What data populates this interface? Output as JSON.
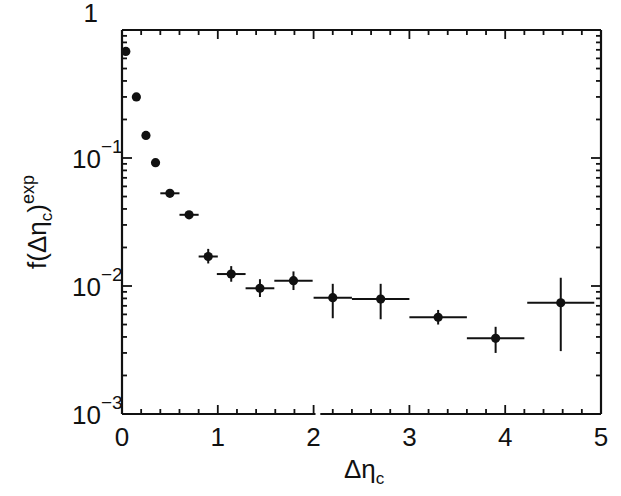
{
  "chart_data": {
    "type": "scatter",
    "title": "",
    "xlabel": "Δη_c",
    "ylabel": "f(Δη_c)^exp",
    "xscale": "linear",
    "yscale": "log",
    "xlim": [
      0,
      5
    ],
    "ylim": [
      0.001,
      1
    ],
    "grid": false,
    "legend": null,
    "x_ticks": [
      0,
      1,
      2,
      3,
      4,
      5
    ],
    "x_tick_labels": [
      "0",
      "1",
      "2",
      "3",
      "4",
      "5"
    ],
    "y_ticks": [
      1,
      0.1,
      0.01,
      0.001
    ],
    "y_tick_labels": [
      {
        "base": "1",
        "exp": ""
      },
      {
        "base": "10",
        "exp": "−1"
      },
      {
        "base": "10",
        "exp": "−2"
      },
      {
        "base": "10",
        "exp": "−3"
      }
    ],
    "series": [
      {
        "name": "data",
        "marker": "filled-circle",
        "points": [
          {
            "x": 0.04,
            "y": 0.68,
            "xerr": 0.04,
            "ylo": 0.68,
            "yhi": 0.68
          },
          {
            "x": 0.15,
            "y": 0.3,
            "xerr": 0.05,
            "ylo": 0.3,
            "yhi": 0.3
          },
          {
            "x": 0.25,
            "y": 0.15,
            "xerr": 0.05,
            "ylo": 0.15,
            "yhi": 0.15
          },
          {
            "x": 0.35,
            "y": 0.092,
            "xerr": 0.05,
            "ylo": 0.092,
            "yhi": 0.092
          },
          {
            "x": 0.5,
            "y": 0.053,
            "xerr": 0.1,
            "ylo": 0.051,
            "yhi": 0.055
          },
          {
            "x": 0.7,
            "y": 0.036,
            "xerr": 0.1,
            "ylo": 0.034,
            "yhi": 0.038
          },
          {
            "x": 0.9,
            "y": 0.017,
            "xerr": 0.1,
            "ylo": 0.015,
            "yhi": 0.0195
          },
          {
            "x": 1.14,
            "y": 0.0124,
            "xerr": 0.15,
            "ylo": 0.0108,
            "yhi": 0.0143
          },
          {
            "x": 1.44,
            "y": 0.0096,
            "xerr": 0.15,
            "ylo": 0.0082,
            "yhi": 0.0113
          },
          {
            "x": 1.79,
            "y": 0.011,
            "xerr": 0.2,
            "ylo": 0.0093,
            "yhi": 0.013
          },
          {
            "x": 2.2,
            "y": 0.0081,
            "xerr": 0.2,
            "ylo": 0.0056,
            "yhi": 0.0104
          },
          {
            "x": 2.7,
            "y": 0.0079,
            "xerr": 0.3,
            "ylo": 0.0055,
            "yhi": 0.0104
          },
          {
            "x": 3.3,
            "y": 0.0057,
            "xerr": 0.3,
            "ylo": 0.005,
            "yhi": 0.0065
          },
          {
            "x": 3.9,
            "y": 0.0039,
            "xerr": 0.3,
            "ylo": 0.003,
            "yhi": 0.0048
          },
          {
            "x": 4.58,
            "y": 0.0074,
            "xerr": 0.35,
            "ylo": 0.0031,
            "yhi": 0.0116
          }
        ]
      }
    ]
  },
  "labels": {
    "xlabel_main": "Δη",
    "xlabel_sub": "c",
    "ylabel_main": "f(Δη",
    "ylabel_sub": "c",
    "ylabel_close": ")",
    "ylabel_sup": "exp"
  }
}
